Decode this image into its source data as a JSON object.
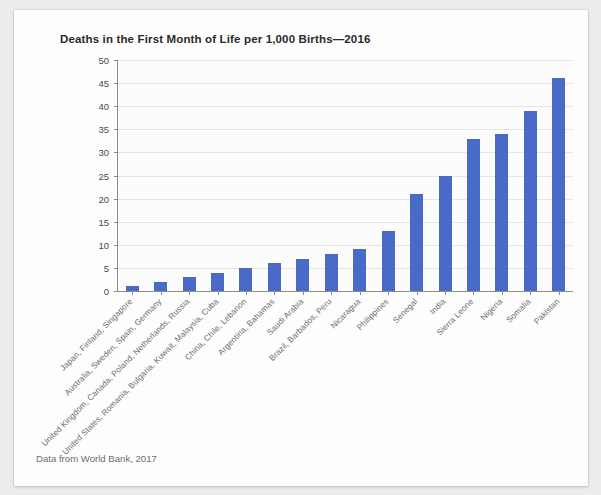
{
  "chart_data": {
    "type": "bar",
    "title": "Deaths in the First Month of Life per 1,000 Births—2016",
    "xlabel": "",
    "ylabel": "",
    "ylim": [
      0,
      50
    ],
    "ytick_step": 5,
    "yticks": [
      0,
      5,
      10,
      15,
      20,
      25,
      30,
      35,
      40,
      45,
      50
    ],
    "grid": true,
    "legend": "none",
    "bar_color": "#4a6ac8",
    "categories": [
      "Japan, Finland, Singapore",
      "Australia, Sweden, Spain, Germany",
      "United Kingdom, Canada, Poland, Netherlands, Russia",
      "United States, Romania, Bulgaria, Kuwait, Malaysia, Cuba",
      "China, Chile, Lebanon",
      "Argentina, Bahamas",
      "Saudi Arabia",
      "Brazil, Barbados, Peru",
      "Nicaragua",
      "Philippines",
      "Senegal",
      "India",
      "Sierra Leone",
      "Nigeria",
      "Somalia",
      "Pakistan"
    ],
    "values": [
      1,
      2,
      3,
      4,
      5,
      6,
      7,
      8,
      9,
      13,
      21,
      25,
      33,
      34,
      39,
      46
    ]
  },
  "footer": {
    "source": "Data from World Bank, 2017"
  }
}
